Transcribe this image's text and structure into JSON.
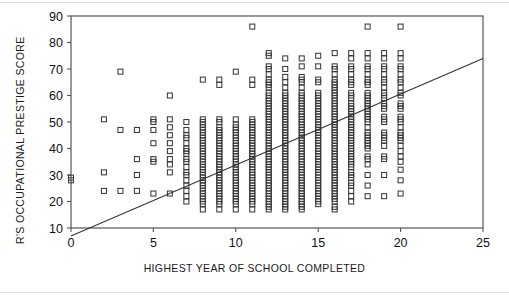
{
  "chart_data": {
    "type": "scatter",
    "title": "",
    "xlabel": "HIGHEST YEAR OF SCHOOL COMPLETED",
    "ylabel": "R'S OCCUPATIONAL PRESTIGE SCORE",
    "xlim": [
      0,
      25
    ],
    "ylim": [
      0,
      90
    ],
    "xticks": [
      0,
      5,
      10,
      15,
      20,
      25
    ],
    "xtick_labels": [
      "0",
      "5",
      "10",
      "15",
      "20",
      "25"
    ],
    "yticks": [
      10,
      20,
      30,
      40,
      50,
      60,
      70,
      80,
      90
    ],
    "ytick_labels": [
      "10",
      "20",
      "30",
      "40",
      "50",
      "60",
      "70",
      "80",
      "90"
    ],
    "grid": false,
    "legend": false,
    "marker": "open-square",
    "marker_size_px": 5,
    "marker_color": "#3a3a3a",
    "axis_color": "#555555",
    "frame": "box",
    "fit_line": {
      "label": "linear regression line",
      "color": "#333333",
      "x_start": 0,
      "y_start": 7,
      "x_end": 25,
      "y_end": 74,
      "slope": 2.68,
      "intercept": 7
    },
    "series": [
      {
        "name": "respondents",
        "columns": [
          {
            "x": 0,
            "values": [
              28,
              29
            ]
          },
          {
            "x": 2,
            "values": [
              51,
              31,
              24
            ]
          },
          {
            "x": 3,
            "values": [
              69,
              47,
              24
            ]
          },
          {
            "x": 4,
            "values": [
              47,
              36,
              30,
              24
            ]
          },
          {
            "x": 5,
            "values": [
              51,
              50,
              47,
              42,
              36,
              35,
              23
            ]
          },
          {
            "x": 6,
            "values": [
              60,
              51,
              48,
              45,
              42,
              39,
              36,
              34,
              31,
              23
            ]
          },
          {
            "x": 7,
            "values": [
              50,
              47,
              45,
              44,
              42,
              40,
              39,
              38,
              36,
              35,
              33,
              31,
              30,
              28,
              26,
              24,
              22,
              20
            ]
          },
          {
            "x": 8,
            "values": [
              66,
              51,
              50,
              49,
              48,
              47,
              46,
              45,
              44,
              43,
              42,
              41,
              40,
              39,
              38,
              37,
              36,
              35,
              34,
              33,
              32,
              31,
              30,
              29,
              28,
              27,
              26,
              25,
              24,
              23,
              22,
              21,
              20,
              19,
              17
            ]
          },
          {
            "x": 9,
            "values": [
              66,
              64,
              51,
              50,
              48,
              47,
              46,
              45,
              44,
              43,
              42,
              41,
              40,
              39,
              38,
              37,
              36,
              35,
              34,
              33,
              32,
              31,
              30,
              29,
              28,
              27,
              26,
              25,
              24,
              23,
              22,
              21,
              20,
              19,
              17
            ]
          },
          {
            "x": 10,
            "values": [
              69,
              51,
              49,
              48,
              47,
              46,
              45,
              44,
              43,
              42,
              41,
              40,
              39,
              38,
              37,
              36,
              35,
              34,
              33,
              32,
              31,
              30,
              29,
              28,
              27,
              26,
              25,
              24,
              23,
              22,
              21,
              20,
              19,
              17
            ]
          },
          {
            "x": 11,
            "values": [
              86,
              66,
              64,
              51,
              50,
              49,
              48,
              47,
              46,
              45,
              44,
              43,
              42,
              41,
              40,
              39,
              38,
              37,
              36,
              35,
              34,
              33,
              32,
              31,
              30,
              29,
              28,
              27,
              26,
              25,
              24,
              23,
              22,
              21,
              20,
              19,
              17
            ]
          },
          {
            "x": 12,
            "values": [
              76,
              75,
              71,
              70,
              68,
              66,
              65,
              64,
              63,
              61,
              60,
              59,
              58,
              57,
              56,
              55,
              54,
              53,
              52,
              51,
              50,
              49,
              48,
              47,
              46,
              45,
              44,
              43,
              42,
              41,
              40,
              39,
              38,
              37,
              36,
              35,
              34,
              33,
              32,
              31,
              30,
              29,
              28,
              27,
              26,
              25,
              24,
              23,
              22,
              21,
              20,
              19,
              18,
              17
            ]
          },
          {
            "x": 13,
            "values": [
              74,
              70,
              67,
              65,
              63,
              61,
              60,
              59,
              58,
              57,
              56,
              55,
              54,
              53,
              52,
              51,
              50,
              49,
              48,
              47,
              46,
              45,
              44,
              43,
              42,
              41,
              40,
              39,
              38,
              37,
              36,
              35,
              34,
              33,
              32,
              31,
              30,
              29,
              28,
              27,
              26,
              25,
              24,
              23,
              22,
              21,
              20,
              19,
              18,
              17
            ]
          },
          {
            "x": 14,
            "values": [
              74,
              71,
              67,
              66,
              65,
              63,
              61,
              60,
              59,
              58,
              57,
              56,
              55,
              54,
              53,
              52,
              51,
              50,
              49,
              48,
              47,
              46,
              45,
              44,
              43,
              42,
              41,
              40,
              39,
              38,
              37,
              36,
              35,
              34,
              33,
              32,
              31,
              30,
              29,
              28,
              27,
              26,
              25,
              24,
              23,
              22,
              21,
              20,
              19,
              18,
              17
            ]
          },
          {
            "x": 15,
            "values": [
              75,
              71,
              66,
              65,
              61,
              60,
              59,
              58,
              57,
              56,
              55,
              54,
              53,
              52,
              51,
              50,
              49,
              48,
              47,
              46,
              45,
              44,
              43,
              42,
              41,
              40,
              39,
              38,
              37,
              36,
              35,
              34,
              33,
              32,
              31,
              30,
              29,
              28,
              27,
              26,
              25,
              24,
              23,
              22,
              21,
              20,
              19
            ]
          },
          {
            "x": 16,
            "values": [
              76,
              71,
              70,
              68,
              66,
              65,
              64,
              63,
              62,
              61,
              60,
              59,
              58,
              57,
              56,
              55,
              54,
              53,
              52,
              51,
              50,
              49,
              48,
              47,
              46,
              45,
              44,
              43,
              42,
              41,
              40,
              39,
              38,
              37,
              36,
              35,
              34,
              33,
              32,
              31,
              30,
              29,
              28,
              27,
              26,
              25,
              24,
              23,
              22,
              21,
              20,
              18,
              17
            ]
          },
          {
            "x": 17,
            "values": [
              76,
              74,
              71,
              70,
              68,
              66,
              65,
              64,
              61,
              60,
              59,
              57,
              56,
              55,
              54,
              53,
              52,
              51,
              50,
              49,
              48,
              47,
              46,
              45,
              44,
              43,
              42,
              41,
              40,
              39,
              38,
              37,
              36,
              35,
              34,
              33,
              31,
              30,
              29,
              27,
              26,
              24,
              22,
              20
            ]
          },
          {
            "x": 18,
            "values": [
              86,
              76,
              74,
              71,
              70,
              68,
              66,
              65,
              64,
              61,
              60,
              59,
              58,
              57,
              56,
              55,
              54,
              53,
              52,
              51,
              50,
              48,
              46,
              45,
              44,
              43,
              42,
              41,
              40,
              37,
              36,
              34,
              30,
              26,
              22
            ]
          },
          {
            "x": 19,
            "values": [
              76,
              74,
              71,
              70,
              68,
              66,
              65,
              63,
              61,
              60,
              59,
              57,
              56,
              55,
              52,
              51,
              50,
              46,
              45,
              44,
              43,
              41,
              37,
              36,
              30,
              22
            ]
          },
          {
            "x": 20,
            "values": [
              86,
              76,
              74,
              71,
              70,
              68,
              66,
              65,
              63,
              61,
              60,
              57,
              56,
              55,
              52,
              51,
              50,
              48,
              46,
              45,
              44,
              43,
              41,
              39,
              37,
              35,
              32,
              28,
              23
            ]
          }
        ]
      }
    ]
  }
}
